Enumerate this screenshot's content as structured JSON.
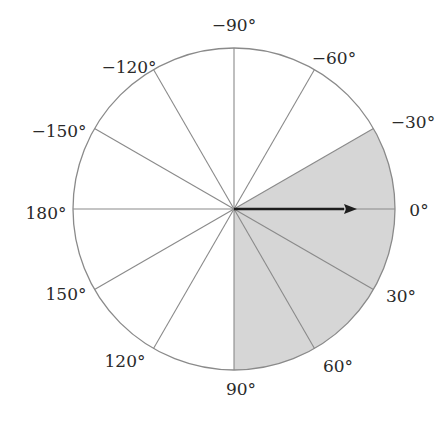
{
  "diagram": {
    "type": "polar-angle-wheel",
    "center": {
      "x": 234,
      "y": 209
    },
    "radius": 161,
    "spoke_interval_deg": 30,
    "colors": {
      "background": "#ffffff",
      "circle_stroke": "#8a8a8a",
      "spoke_stroke": "#8a8a8a",
      "shaded_fill": "#d6d6d6",
      "arrow": "#1e1e1e",
      "label_text": "#2a2a2a"
    },
    "shaded_sector": {
      "start_deg": -30,
      "end_deg": 90
    },
    "arrow": {
      "angle_deg": 0,
      "length": 123
    },
    "labels": [
      {
        "text": "−90°",
        "angle": -90,
        "x": 234,
        "y": 31,
        "anchor": "middle"
      },
      {
        "text": "−60°",
        "angle": -60,
        "x": 334,
        "y": 64,
        "anchor": "middle"
      },
      {
        "text": "−120°",
        "angle": -120,
        "x": 129,
        "y": 73,
        "anchor": "middle"
      },
      {
        "text": "−30°",
        "angle": -30,
        "x": 413,
        "y": 128,
        "anchor": "middle"
      },
      {
        "text": "−150°",
        "angle": -150,
        "x": 59,
        "y": 137,
        "anchor": "middle"
      },
      {
        "text": "180°",
        "angle": 180,
        "x": 46,
        "y": 219,
        "anchor": "middle"
      },
      {
        "text": "0°",
        "angle": 0,
        "x": 419,
        "y": 216,
        "anchor": "middle"
      },
      {
        "text": "150°",
        "angle": 150,
        "x": 66,
        "y": 300,
        "anchor": "middle"
      },
      {
        "text": "30°",
        "angle": 30,
        "x": 401,
        "y": 302,
        "anchor": "middle"
      },
      {
        "text": "120°",
        "angle": 120,
        "x": 125,
        "y": 367,
        "anchor": "middle"
      },
      {
        "text": "60°",
        "angle": 60,
        "x": 338,
        "y": 372,
        "anchor": "middle"
      },
      {
        "text": "90°",
        "angle": 90,
        "x": 241,
        "y": 395,
        "anchor": "middle"
      }
    ]
  }
}
